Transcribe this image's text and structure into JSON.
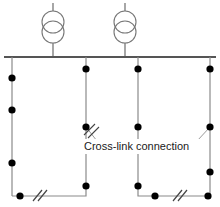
{
  "diagram": {
    "type": "electrical-single-line",
    "colors": {
      "line": "#777777",
      "busbar": "#555555",
      "node": "#000000",
      "text": "#1a1a1a",
      "background": "#ffffff"
    },
    "annotation": {
      "cross_link_label": "Cross-link connection"
    },
    "busbar": {
      "name": "main-busbar",
      "x1": 4,
      "x2": 216,
      "y": 57,
      "stroke_width": 1.6
    },
    "transformers": [
      {
        "name": "transformer-1",
        "cx": 53,
        "top_lead_y": 3,
        "circle_top_cy": 22,
        "circle_bottom_cy": 32,
        "radius": 11,
        "bottom_lead_y": 57
      },
      {
        "name": "transformer-2",
        "cx": 125,
        "top_lead_y": 3,
        "circle_top_cy": 22,
        "circle_bottom_cy": 32,
        "radius": 11,
        "bottom_lead_y": 57
      }
    ],
    "feeders": [
      {
        "name": "feeder-1",
        "x": 12,
        "y_top": 57,
        "y_bottom": 196
      },
      {
        "name": "feeder-2",
        "x": 86,
        "y_top": 57,
        "y_bottom": 186
      },
      {
        "name": "feeder-3",
        "x": 138,
        "y_top": 57,
        "y_bottom": 186
      },
      {
        "name": "feeder-4",
        "x": 210,
        "y_top": 57,
        "y_bottom": 196
      }
    ],
    "nodes": [
      {
        "name": "node-f1-a",
        "x": 12,
        "y": 78
      },
      {
        "name": "node-f1-b",
        "x": 12,
        "y": 110
      },
      {
        "name": "node-f1-c",
        "x": 12,
        "y": 163
      },
      {
        "name": "node-f1-bottom",
        "x": 20,
        "y": 196
      },
      {
        "name": "node-f2-a",
        "x": 86,
        "y": 69
      },
      {
        "name": "node-f2-crosslink",
        "x": 86,
        "y": 127
      },
      {
        "name": "node-f2-bottom",
        "x": 86,
        "y": 186
      },
      {
        "name": "node-f3-a",
        "x": 138,
        "y": 69
      },
      {
        "name": "node-f3-b",
        "x": 138,
        "y": 127
      },
      {
        "name": "node-f3-bottom",
        "x": 138,
        "y": 186
      },
      {
        "name": "node-f4-a",
        "x": 210,
        "y": 69
      },
      {
        "name": "node-f4-crosslink",
        "x": 210,
        "y": 127
      },
      {
        "name": "node-f4-b",
        "x": 210,
        "y": 172
      },
      {
        "name": "node-f4-bottom",
        "x": 208,
        "y": 196
      },
      {
        "name": "node-br-left",
        "x": 155,
        "y": 196
      }
    ],
    "tie_lines": [
      {
        "name": "bottom-left-tie",
        "points": "12,196 86,196 86,186",
        "break_symbol": {
          "cx": 38,
          "cy": 196
        }
      },
      {
        "name": "bottom-right-tie",
        "points": "138,186 138,196 208,196",
        "break_symbol": {
          "cx": 178,
          "cy": 196
        }
      }
    ],
    "leaders": [
      {
        "name": "leader-left",
        "points": "86,127 96,140",
        "break_symbol": {
          "cx": 92,
          "cy": 134
        }
      },
      {
        "name": "leader-right",
        "points": "196,140 210,127"
      }
    ],
    "label_box": {
      "name": "cross-link-label-box",
      "x": 80,
      "y": 139,
      "width": 120,
      "height": 14,
      "text_x": 84,
      "text_y": 147
    }
  }
}
